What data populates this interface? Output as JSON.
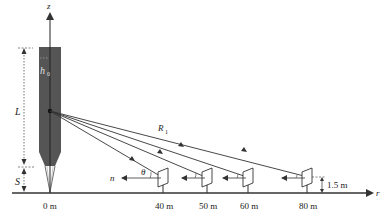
{
  "diagram": {
    "axes": {
      "vertical_label": "z",
      "horizontal_label": "r"
    },
    "source": {
      "length_label": "L",
      "gap_label": "S",
      "top_label": "h",
      "top_label_subscript": "0",
      "fill_color": "#555555"
    },
    "rays": {
      "distance_label": "R",
      "distance_subscript": "1",
      "angle_label": "θ",
      "normal_label": "n"
    },
    "detectors": [
      {
        "position_label": "40 m",
        "x": 163
      },
      {
        "position_label": "50 m",
        "x": 207
      },
      {
        "position_label": "60 m",
        "x": 248
      },
      {
        "position_label": "80 m",
        "x": 307
      }
    ],
    "origin_label": "0 m",
    "detector_height_label": "1.5 m",
    "line_color": "#333333"
  }
}
